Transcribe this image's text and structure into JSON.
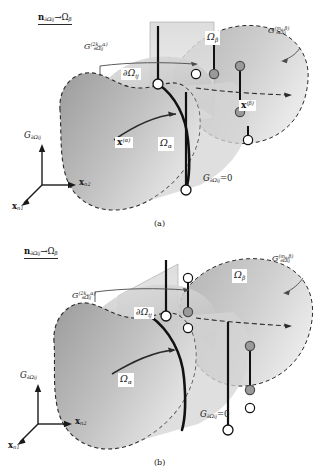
{
  "figure": {
    "background_color": "#ffffff",
    "line_color": "#1a1a1a",
    "body_fill_alpha": "#b9b9b9",
    "body_fill_beta": "#cdcdcd",
    "marker_white": "#ffffff",
    "marker_gray": "#9a9a9a"
  },
  "panels": [
    {
      "id": "a",
      "caption": "(a)",
      "normal_label": {
        "base": "n",
        "sub": "∂Ω",
        "sub2": "ij",
        "arrow": "→",
        "target": "Ω",
        "target_sub": "β"
      },
      "labels": {
        "green_alpha": {
          "base": "G",
          "sup": "(2k",
          "sup_sub": "α",
          "sup_rest": ",α)",
          "sub": "∂Ω",
          "sub2": "ij"
        },
        "green_beta": {
          "base": "G",
          "sup": "(m",
          "sup_sub": "β",
          "sup_rest": ",β)",
          "sub": "∂Ω",
          "sub2": "ij"
        },
        "interface": {
          "base": "∂Ω",
          "sub": "ij"
        },
        "domain_alpha": {
          "base": "Ω",
          "sub": "α"
        },
        "domain_beta": {
          "base": "Ω",
          "sub": "β"
        },
        "point_alpha": {
          "base": "x",
          "sup": "(α)"
        },
        "point_beta": {
          "base": "x",
          "sup": "(β)"
        },
        "green_zero": {
          "base": "G",
          "sub": "∂Ω",
          "sub2": "ij",
          "eq": "=0"
        }
      },
      "axes": {
        "vertical": {
          "base": "G",
          "sub": "∂Ω",
          "sub2": "ij"
        },
        "horizontal": {
          "base": "x",
          "sub": "n",
          "sub2": "2"
        },
        "diagonal": {
          "base": "x",
          "sub": "n",
          "sub2": "1"
        }
      }
    },
    {
      "id": "b",
      "caption": "(b)",
      "normal_label": {
        "base": "n",
        "sub": "∂Ω",
        "sub2": "ij",
        "arrow": "→",
        "target": "Ω",
        "target_sub": "β"
      },
      "labels": {
        "green_alpha": {
          "base": "G",
          "sup": "(2k",
          "sup_sub": "α",
          "sup_rest": ",α)",
          "sub": "∂Ω",
          "sub2": "ij"
        },
        "green_beta": {
          "base": "G",
          "sup": "(m",
          "sup_sub": "β",
          "sup_rest": ",β)",
          "sub": "∂Ω",
          "sub2": "ij"
        },
        "interface": {
          "base": "∂Ω",
          "sub": "ij"
        },
        "domain_alpha": {
          "base": "Ω",
          "sub": "α"
        },
        "domain_beta": {
          "base": "Ω",
          "sub": "β"
        },
        "green_zero": {
          "base": "G",
          "sub": "∂Ω",
          "sub2": "ij",
          "eq": "=0"
        }
      },
      "axes": {
        "vertical": {
          "base": "G",
          "sub": "∂Ω",
          "sub2": "ij"
        },
        "horizontal": {
          "base": "x",
          "sub": "n",
          "sub2": "2"
        },
        "diagonal": {
          "base": "x",
          "sub": "n",
          "sub2": "1"
        }
      }
    }
  ]
}
